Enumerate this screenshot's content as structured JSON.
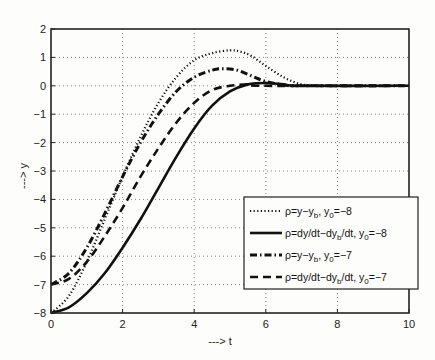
{
  "chart_data": {
    "type": "line",
    "title": "",
    "xlabel": "---> t",
    "ylabel": "---> y",
    "xlim": [
      0,
      10
    ],
    "ylim": [
      -8,
      2
    ],
    "xticks": [
      0,
      2,
      4,
      6,
      8,
      10
    ],
    "yticks": [
      2,
      1,
      0,
      -1,
      -2,
      -3,
      -4,
      -5,
      -6,
      -7,
      -8
    ],
    "grid": true,
    "legend_position": "center-right",
    "series": [
      {
        "name": "ρ=y−y_b, y_0=−8",
        "label_main": "ρ=y−y",
        "label_sub1": "b",
        "label_mid": ", y",
        "label_sub2": "0",
        "label_end": "=−8",
        "style": "dotted",
        "x": [
          0,
          0.5,
          1,
          1.5,
          2,
          2.5,
          3,
          3.5,
          4,
          4.5,
          5,
          5.3,
          5.6,
          6,
          6.5,
          7,
          7.5,
          8,
          10
        ],
        "y": [
          -8,
          -7.4,
          -6.2,
          -4.7,
          -3.2,
          -1.8,
          -0.6,
          0.3,
          0.9,
          1.15,
          1.25,
          1.2,
          1.05,
          0.7,
          0.3,
          0.05,
          0,
          0,
          0
        ]
      },
      {
        "name": "ρ=dy/dt−dy_b/dt, y_0=−8",
        "label_main": "ρ=dy/dt−dy",
        "label_sub1": "b",
        "label_mid": "/dt, y",
        "label_sub2": "0",
        "label_end": "=−8",
        "style": "solid",
        "x": [
          0,
          0.5,
          1,
          1.5,
          2,
          2.5,
          3,
          3.5,
          4,
          4.5,
          5,
          5.5,
          6,
          6.5,
          7,
          10
        ],
        "y": [
          -8,
          -7.8,
          -7.3,
          -6.6,
          -5.7,
          -4.7,
          -3.6,
          -2.5,
          -1.5,
          -0.7,
          -0.2,
          0.05,
          0.1,
          0.05,
          0,
          0
        ]
      },
      {
        "name": "ρ=y−y_b, y_0=−7",
        "label_main": "ρ=y−y",
        "label_sub1": "b",
        "label_mid": ", y",
        "label_sub2": "0",
        "label_end": "=−7",
        "style": "dashdot",
        "x": [
          0,
          0.5,
          1,
          1.5,
          2,
          2.5,
          3,
          3.5,
          4,
          4.5,
          4.8,
          5.2,
          5.6,
          6,
          6.5,
          7,
          10
        ],
        "y": [
          -7,
          -6.6,
          -5.7,
          -4.5,
          -3.2,
          -2.0,
          -1.0,
          -0.2,
          0.3,
          0.55,
          0.6,
          0.55,
          0.35,
          0.15,
          0.03,
          0,
          0
        ]
      },
      {
        "name": "ρ=dy/dt−dy_b/dt, y_0=−7",
        "label_main": "ρ=dy/dt−dy",
        "label_sub1": "b",
        "label_mid": "/dt, y",
        "label_sub2": "0",
        "label_end": "=−7",
        "style": "dashed",
        "x": [
          0,
          0.5,
          1,
          1.5,
          2,
          2.5,
          3,
          3.5,
          4,
          4.5,
          5,
          5.5,
          6,
          10
        ],
        "y": [
          -7,
          -6.8,
          -6.2,
          -5.3,
          -4.3,
          -3.2,
          -2.2,
          -1.3,
          -0.6,
          -0.15,
          0,
          0.05,
          0,
          0
        ]
      }
    ]
  }
}
